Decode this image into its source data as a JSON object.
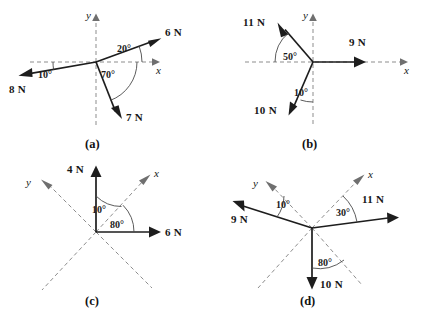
{
  "figure": {
    "title_visible": false,
    "background_color": "#ffffff",
    "solid_vector_color": "#1d1d1d",
    "dashed_axis_color": "#8d8d8d",
    "arc_color": "#4a4a4a",
    "panel_count": 4
  },
  "panels": [
    {
      "id": "a",
      "caption": "(a)",
      "axis_style": "horizontal-vertical",
      "axis_labels": {
        "x": "x",
        "y": "y"
      },
      "forces": [
        {
          "label": "6 N",
          "magnitude": 6,
          "unit": "N",
          "direction_deg": 20
        },
        {
          "label": "8 N",
          "magnitude": 8,
          "unit": "N",
          "direction_deg": 190
        },
        {
          "label": "7 N",
          "magnitude": 7,
          "unit": "N",
          "direction_deg": -70
        }
      ],
      "angles": [
        {
          "label": "20°",
          "value": 20,
          "measured_from": "+x axis",
          "to": "6 N"
        },
        {
          "label": "10°",
          "value": 10,
          "measured_from": "−x axis",
          "to": "8 N"
        },
        {
          "label": "70°",
          "value": 70,
          "measured_from": "+x axis",
          "to": "7 N"
        }
      ]
    },
    {
      "id": "b",
      "caption": "(b)",
      "axis_style": "horizontal-vertical",
      "axis_labels": {
        "x": "x",
        "y": "y"
      },
      "forces": [
        {
          "label": "9 N",
          "magnitude": 9,
          "unit": "N",
          "direction_deg": 0
        },
        {
          "label": "11 N",
          "magnitude": 11,
          "unit": "N",
          "direction_deg": 130
        },
        {
          "label": "10 N",
          "magnitude": 10,
          "unit": "N",
          "direction_deg": 260
        }
      ],
      "angles": [
        {
          "label": "50°",
          "value": 50,
          "measured_from": "−x axis",
          "to": "11 N"
        },
        {
          "label": "10°",
          "value": 10,
          "measured_from": "−y axis",
          "to": "10 N"
        }
      ]
    },
    {
      "id": "c",
      "caption": "(c)",
      "axis_style": "rotated-dashed",
      "axis_labels": {
        "x": "x",
        "y": "y"
      },
      "forces": [
        {
          "label": "4 N",
          "magnitude": 4,
          "unit": "N",
          "direction_deg": 90
        },
        {
          "label": "6 N",
          "magnitude": 6,
          "unit": "N",
          "direction_deg": 0
        }
      ],
      "angles": [
        {
          "label": "10°",
          "value": 10,
          "measured_from": "4 N (vertical)",
          "to": "x axis"
        },
        {
          "label": "80°",
          "value": 80,
          "measured_from": "6 N (horizontal)",
          "to": "x axis"
        }
      ]
    },
    {
      "id": "d",
      "caption": "(d)",
      "axis_style": "rotated-dashed",
      "axis_labels": {
        "x": "x",
        "y": "y"
      },
      "forces": [
        {
          "label": "11 N",
          "magnitude": 11,
          "unit": "N",
          "direction_deg": 8
        },
        {
          "label": "9 N",
          "magnitude": 9,
          "unit": "N",
          "direction_deg": 162
        },
        {
          "label": "10 N",
          "magnitude": 10,
          "unit": "N",
          "direction_deg": 270
        }
      ],
      "angles": [
        {
          "label": "10°",
          "value": 10,
          "measured_from": "9 N",
          "to": "y axis"
        },
        {
          "label": "30°",
          "value": 30,
          "measured_from": "11 N",
          "to": "x axis"
        },
        {
          "label": "80°",
          "value": 80,
          "measured_from": "10 N",
          "to": "−x axis"
        }
      ]
    }
  ]
}
